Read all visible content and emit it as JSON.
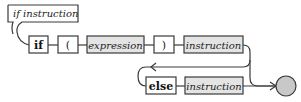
{
  "diagram": {
    "title": "if instruction",
    "type": "syntax-railroad-diagram",
    "main_row": [
      {
        "kind": "terminal",
        "label": "if"
      },
      {
        "kind": "terminal",
        "label": "("
      },
      {
        "kind": "nonterminal",
        "label": "expression"
      },
      {
        "kind": "terminal",
        "label": ")"
      },
      {
        "kind": "nonterminal",
        "label": "instruction"
      }
    ],
    "else_row": [
      {
        "kind": "terminal",
        "label": "else"
      },
      {
        "kind": "nonterminal",
        "label": "instruction"
      }
    ],
    "colors": {
      "stroke": "#3a3a3a",
      "nonterminal_fill": "#e4e4e4",
      "terminal_fill": "#ffffff",
      "end_circle_fill": "#c8c8c8"
    }
  }
}
